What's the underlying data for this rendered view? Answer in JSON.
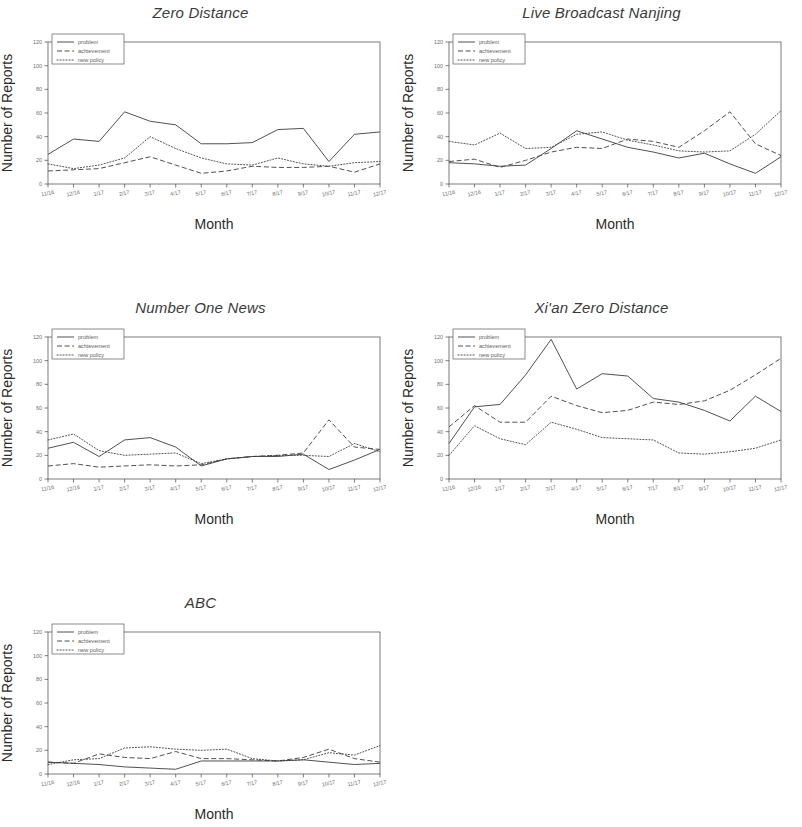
{
  "figure": {
    "axis_labels": {
      "x": "Month",
      "y": "Number of Reports"
    },
    "series_names": [
      "problem",
      "achievement",
      "new policy"
    ],
    "line_styles": [
      "solid",
      "dashed",
      "dotted"
    ],
    "accent_color": "#3d3d3d",
    "axis_color": "#4a4a4a",
    "background": "#ffffff"
  },
  "chart_data": [
    {
      "type": "line",
      "title": "Zero Distance",
      "xlabel": "Month",
      "ylabel": "Number of Reports",
      "ylim": [
        0,
        120
      ],
      "yticks": [
        0,
        20,
        40,
        60,
        80,
        100,
        120
      ],
      "grid": false,
      "legend_position": "top-left",
      "categories": [
        "11/16",
        "12/16",
        "1/17",
        "2/17",
        "3/17",
        "4/17",
        "5/17",
        "6/17",
        "7/17",
        "8/17",
        "9/17",
        "10/17",
        "11/17",
        "12/17"
      ],
      "series": [
        {
          "name": "problem",
          "style": "solid",
          "values": [
            25,
            38,
            36,
            61,
            53,
            50,
            34,
            34,
            35,
            46,
            47,
            19,
            42,
            44
          ]
        },
        {
          "name": "achievement",
          "style": "dashed",
          "values": [
            11,
            12,
            13,
            18,
            23,
            16,
            9,
            11,
            15,
            14,
            14,
            15,
            10,
            17
          ]
        },
        {
          "name": "new policy",
          "style": "dotted",
          "values": [
            17,
            13,
            16,
            22,
            40,
            30,
            22,
            17,
            16,
            22,
            17,
            15,
            18,
            19
          ]
        }
      ]
    },
    {
      "type": "line",
      "title": "Live Broadcast Nanjing",
      "xlabel": "Month",
      "ylabel": "Number of Reports",
      "ylim": [
        0,
        120
      ],
      "yticks": [
        0,
        20,
        40,
        60,
        80,
        100,
        120
      ],
      "grid": false,
      "legend_position": "top-left",
      "categories": [
        "11/16",
        "12/16",
        "1/17",
        "2/17",
        "3/17",
        "4/17",
        "5/17",
        "6/17",
        "7/17",
        "8/17",
        "9/17",
        "10/17",
        "11/17",
        "12/17"
      ],
      "series": [
        {
          "name": "problem",
          "style": "solid",
          "values": [
            18,
            17,
            15,
            16,
            30,
            45,
            38,
            31,
            27,
            22,
            26,
            17,
            9,
            23
          ]
        },
        {
          "name": "achievement",
          "style": "dashed",
          "values": [
            19,
            21,
            14,
            20,
            27,
            31,
            30,
            38,
            36,
            31,
            45,
            61,
            34,
            24
          ]
        },
        {
          "name": "new policy",
          "style": "dotted",
          "values": [
            36,
            33,
            43,
            30,
            31,
            42,
            44,
            37,
            33,
            28,
            27,
            28,
            42,
            62
          ]
        }
      ]
    },
    {
      "type": "line",
      "title": "Number One News",
      "xlabel": "Month",
      "ylabel": "Number of Reports",
      "ylim": [
        0,
        120
      ],
      "yticks": [
        0,
        20,
        40,
        60,
        80,
        100,
        120
      ],
      "grid": false,
      "legend_position": "top-left",
      "categories": [
        "11/16",
        "12/16",
        "1/17",
        "2/17",
        "3/17",
        "4/17",
        "5/17",
        "6/17",
        "7/17",
        "8/17",
        "9/17",
        "10/17",
        "11/17",
        "12/17"
      ],
      "series": [
        {
          "name": "problem",
          "style": "solid",
          "values": [
            26,
            31,
            19,
            33,
            35,
            27,
            11,
            17,
            19,
            19,
            21,
            8,
            16,
            25
          ]
        },
        {
          "name": "achievement",
          "style": "dashed",
          "values": [
            11,
            13,
            10,
            11,
            12,
            11,
            12,
            17,
            19,
            20,
            22,
            50,
            27,
            25
          ]
        },
        {
          "name": "new policy",
          "style": "dotted",
          "values": [
            33,
            38,
            24,
            20,
            21,
            22,
            13,
            17,
            19,
            20,
            20,
            19,
            30,
            23
          ]
        }
      ]
    },
    {
      "type": "line",
      "title": "Xi'an Zero Distance",
      "xlabel": "Month",
      "ylabel": "Number of Reports",
      "ylim": [
        0,
        120
      ],
      "yticks": [
        0,
        20,
        40,
        60,
        80,
        100,
        120
      ],
      "grid": false,
      "legend_position": "top-left",
      "categories": [
        "11/16",
        "12/16",
        "1/17",
        "2/17",
        "3/17",
        "4/17",
        "5/17",
        "6/17",
        "7/17",
        "8/17",
        "9/17",
        "10/17",
        "11/17",
        "12/17"
      ],
      "series": [
        {
          "name": "problem",
          "style": "solid",
          "values": [
            30,
            61,
            63,
            88,
            118,
            76,
            89,
            87,
            68,
            65,
            58,
            49,
            70,
            57
          ]
        },
        {
          "name": "achievement",
          "style": "dashed",
          "values": [
            44,
            62,
            48,
            48,
            70,
            62,
            56,
            58,
            65,
            63,
            66,
            75,
            88,
            102
          ]
        },
        {
          "name": "new policy",
          "style": "dotted",
          "values": [
            20,
            45,
            34,
            29,
            48,
            42,
            35,
            34,
            33,
            22,
            21,
            23,
            26,
            33
          ]
        }
      ]
    },
    {
      "type": "line",
      "title": "ABC",
      "xlabel": "Month",
      "ylabel": "Number of Reports",
      "ylim": [
        0,
        120
      ],
      "yticks": [
        0,
        20,
        40,
        60,
        80,
        100,
        120
      ],
      "grid": false,
      "legend_position": "top-left",
      "categories": [
        "11/16",
        "12/16",
        "1/17",
        "2/17",
        "3/17",
        "4/17",
        "5/17",
        "6/17",
        "7/17",
        "8/17",
        "9/17",
        "10/17",
        "11/17",
        "12/17"
      ],
      "series": [
        {
          "name": "problem",
          "style": "solid",
          "values": [
            10,
            9,
            8,
            6,
            5,
            4,
            11,
            11,
            11,
            11,
            12,
            10,
            8,
            9
          ]
        },
        {
          "name": "achievement",
          "style": "dashed",
          "values": [
            10,
            9,
            17,
            14,
            13,
            19,
            13,
            13,
            12,
            11,
            14,
            21,
            13,
            10
          ]
        },
        {
          "name": "new policy",
          "style": "dotted",
          "values": [
            8,
            12,
            13,
            22,
            23,
            21,
            20,
            21,
            13,
            11,
            12,
            18,
            16,
            24
          ]
        }
      ]
    }
  ]
}
